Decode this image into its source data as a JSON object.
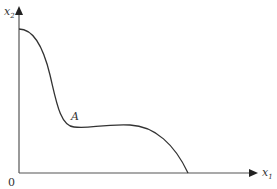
{
  "diagram": {
    "axes": {
      "x_label": "x",
      "x_sub": "1",
      "y_label": "x",
      "y_sub": "2",
      "origin_label": "0"
    },
    "curve": {
      "point_label": "A",
      "color": "#333333"
    },
    "colors": {
      "axis": "#555555",
      "background": "#ffffff"
    }
  }
}
